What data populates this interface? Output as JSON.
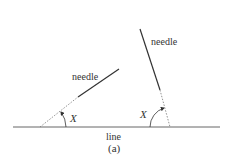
{
  "figure": {
    "caption": "(a)",
    "baseline_label": "line",
    "needles": [
      {
        "label": "needle",
        "angle_label": "X"
      },
      {
        "label": "needle",
        "angle_label": "X"
      }
    ]
  },
  "colors": {
    "line": "#555555",
    "text": "#333333"
  }
}
